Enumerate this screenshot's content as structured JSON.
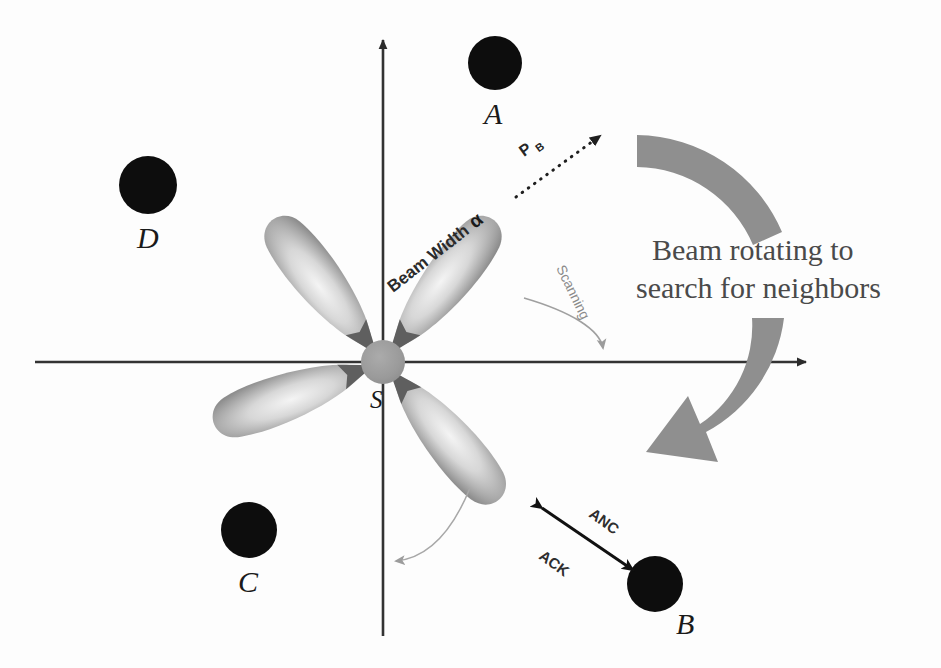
{
  "figure": {
    "title_caption": "Beam rotating to search for neighbors",
    "caption_line1": "Beam rotating to",
    "caption_line2": "search for neighbors",
    "background_color": "#fdfdfd"
  },
  "axes": {
    "x_axis": {
      "name": "horizontal-axis",
      "color": "#333333",
      "has_arrow_right": true
    },
    "y_axis": {
      "name": "vertical-axis",
      "color": "#333333",
      "has_arrow_top": true
    }
  },
  "center_node": {
    "label": "S",
    "color": "#9a9a9a",
    "radius": 22
  },
  "nodes": [
    {
      "id": "A",
      "label": "A",
      "color": "#0d0d0d",
      "cx": 495,
      "cy": 63,
      "r": 27,
      "label_x": 491,
      "label_y": 118
    },
    {
      "id": "B",
      "label": "B",
      "color": "#0d0d0d",
      "cx": 655,
      "cy": 584,
      "r": 28,
      "label_x": 686,
      "label_y": 626
    },
    {
      "id": "C",
      "label": "C",
      "color": "#0d0d0d",
      "cx": 249,
      "cy": 530,
      "r": 28,
      "label_x": 243,
      "label_y": 589
    },
    {
      "id": "D",
      "label": "D",
      "color": "#0d0d0d",
      "cx": 148,
      "cy": 185,
      "r": 29,
      "label_x": 142,
      "label_y": 243
    }
  ],
  "beams": {
    "count": 4,
    "color_edge": "#8e8e8e",
    "color_core": "#e8e8e8",
    "angles_deg": [
      -52,
      -128,
      128,
      52
    ]
  },
  "annotations": {
    "beam_width": {
      "label": "Beam Width",
      "symbol": "α"
    },
    "power_beam": {
      "label": "P",
      "subscript": "B"
    },
    "scanning": {
      "label": "Scanning"
    },
    "anc": {
      "label": "ANC"
    },
    "ack": {
      "label": "ACK"
    }
  },
  "rotation_arrow": {
    "name": "beam-rotation-arrow",
    "color": "#8c8c8c",
    "direction": "clockwise"
  }
}
